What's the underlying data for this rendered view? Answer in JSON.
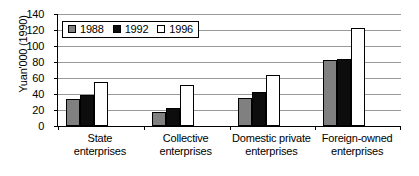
{
  "chart_data": {
    "type": "bar",
    "title": "",
    "xlabel": "",
    "ylabel": "Yuan'000 (1990)",
    "ylim": [
      0,
      140
    ],
    "yticks": [
      140,
      120,
      100,
      80,
      60,
      40,
      20,
      0
    ],
    "grid": true,
    "legend_position": "top-left",
    "categories": [
      "State enterprises",
      "Collective enterprises",
      "Domestic private enterprises",
      "Foreign-owned enterprises"
    ],
    "category_lines": [
      [
        "State",
        "enterprises"
      ],
      [
        "Collective",
        "enterprises"
      ],
      [
        "Domestic private",
        "enterprises"
      ],
      [
        "Foreign-owned",
        "enterprises"
      ]
    ],
    "series": [
      {
        "name": "1988",
        "color": "#808080",
        "values": [
          34,
          17,
          35,
          82
        ]
      },
      {
        "name": "1992",
        "color": "#0d0d0d",
        "values": [
          39,
          23,
          42,
          84
        ]
      },
      {
        "name": "1996",
        "color": "#ffffff",
        "values": [
          55,
          51,
          64,
          123
        ]
      }
    ]
  }
}
